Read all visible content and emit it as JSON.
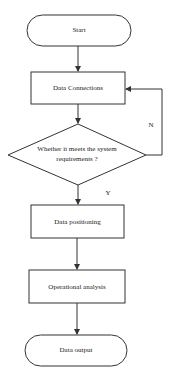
{
  "diagram": {
    "type": "flowchart",
    "nodes": [
      {
        "id": "start",
        "shape": "terminal",
        "label": "Start"
      },
      {
        "id": "data_connections",
        "shape": "process",
        "label": "Data Connections"
      },
      {
        "id": "decision",
        "shape": "decision",
        "label_line1": "Whether it meets the system",
        "label_line2": "requirements ?"
      },
      {
        "id": "data_positioning",
        "shape": "process",
        "label": "Data positioning"
      },
      {
        "id": "operational_analysis",
        "shape": "process",
        "label": "Operational analysis"
      },
      {
        "id": "data_output",
        "shape": "terminal",
        "label": "Data output"
      }
    ],
    "edges": {
      "no_label": "N",
      "yes_label": "Y"
    },
    "colors": {
      "stroke": "#333333",
      "fill": "#ffffff",
      "text": "#222222"
    }
  }
}
